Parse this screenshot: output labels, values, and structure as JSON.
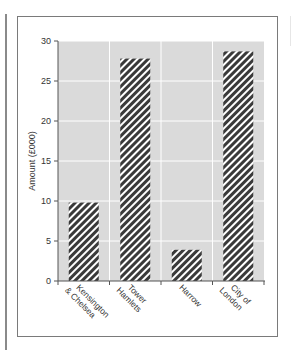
{
  "chart_data": {
    "type": "bar",
    "title": "",
    "xlabel": "",
    "ylabel": "Amount (£000)",
    "categories": [
      "Kensington & Chelsea",
      "Tower Hamlets",
      "Harrow",
      "City of London"
    ],
    "category_lines": [
      [
        "Kensington",
        "& Chelsea"
      ],
      [
        "Tower",
        "Hamlets"
      ],
      [
        "Harrow"
      ],
      [
        "City of",
        "London"
      ]
    ],
    "values": [
      9.8,
      27.8,
      3.9,
      28.7
    ],
    "ylim": [
      0,
      30
    ],
    "yticks": [
      0,
      5,
      10,
      15,
      20,
      25,
      30
    ],
    "grid": true,
    "legend": null,
    "bar_fill": "diagonal-hatch",
    "colors": {
      "plot_background": "#dadada",
      "gridline": "#ffffff",
      "bar_stripe_dark": "#3a3a3a",
      "bar_stripe_light": "#ffffff",
      "axis": "#555555"
    }
  }
}
